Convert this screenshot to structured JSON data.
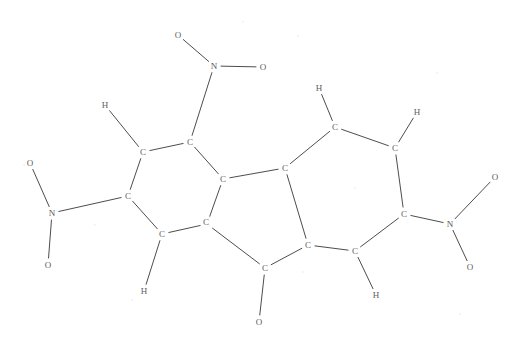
{
  "image": {
    "kind": "chemical-structure-diagram",
    "title": "",
    "width": 518,
    "height": 345,
    "background_color": "#ffffff",
    "bond_color": "#4d4d4d",
    "label_color": "#5b5b5b",
    "bond_width": 1
  },
  "molecule": {
    "core": "tricyclic fluorene-like skeleton: two six-membered carbon rings fused to a central five-membered ring",
    "substituents": "three nitro groups (N with two O) and one carbonyl oxygen",
    "atoms": [
      {
        "id": "O1",
        "label": "O",
        "element": "oxygen",
        "x": 178,
        "y": 35
      },
      {
        "id": "N1",
        "label": "N",
        "element": "nitrogen",
        "x": 214,
        "y": 66
      },
      {
        "id": "O2",
        "label": "O",
        "element": "oxygen",
        "x": 263,
        "y": 67
      },
      {
        "id": "C1",
        "label": "C",
        "element": "carbon",
        "x": 190,
        "y": 142
      },
      {
        "id": "H1",
        "label": "H",
        "element": "hydrogen",
        "x": 105,
        "y": 105
      },
      {
        "id": "C2",
        "label": "C",
        "element": "carbon",
        "x": 143,
        "y": 152
      },
      {
        "id": "C3",
        "label": "C",
        "element": "carbon",
        "x": 128,
        "y": 196
      },
      {
        "id": "N2",
        "label": "N",
        "element": "nitrogen",
        "x": 52,
        "y": 213
      },
      {
        "id": "O3",
        "label": "O",
        "element": "oxygen",
        "x": 30,
        "y": 163
      },
      {
        "id": "O4",
        "label": "O",
        "element": "oxygen",
        "x": 48,
        "y": 265
      },
      {
        "id": "C4",
        "label": "C",
        "element": "carbon",
        "x": 162,
        "y": 234
      },
      {
        "id": "H2",
        "label": "H",
        "element": "hydrogen",
        "x": 144,
        "y": 291
      },
      {
        "id": "C5",
        "label": "C",
        "element": "carbon",
        "x": 207,
        "y": 224
      },
      {
        "id": "C6",
        "label": "C",
        "element": "carbon",
        "x": 223,
        "y": 179
      },
      {
        "id": "C7",
        "label": "C",
        "element": "carbon",
        "x": 285,
        "y": 168
      },
      {
        "id": "C8",
        "label": "C",
        "element": "carbon",
        "x": 206,
        "y": 222
      },
      {
        "id": "C9",
        "label": "C",
        "element": "carbon",
        "x": 308,
        "y": 245
      },
      {
        "id": "C10",
        "label": "C",
        "element": "carbon",
        "x": 265,
        "y": 268
      },
      {
        "id": "O5",
        "label": "O",
        "element": "oxygen",
        "x": 259,
        "y": 322
      },
      {
        "id": "C11",
        "label": "C",
        "element": "carbon",
        "x": 335,
        "y": 127
      },
      {
        "id": "H3",
        "label": "H",
        "element": "hydrogen",
        "x": 319,
        "y": 88
      },
      {
        "id": "C12",
        "label": "C",
        "element": "carbon",
        "x": 395,
        "y": 148
      },
      {
        "id": "H4",
        "label": "H",
        "element": "hydrogen",
        "x": 417,
        "y": 112
      },
      {
        "id": "C13",
        "label": "C",
        "element": "carbon",
        "x": 404,
        "y": 214
      },
      {
        "id": "N3",
        "label": "N",
        "element": "nitrogen",
        "x": 450,
        "y": 224
      },
      {
        "id": "O6",
        "label": "O",
        "element": "oxygen",
        "x": 495,
        "y": 177
      },
      {
        "id": "O7",
        "label": "O",
        "element": "oxygen",
        "x": 470,
        "y": 267
      },
      {
        "id": "C14",
        "label": "C",
        "element": "carbon",
        "x": 355,
        "y": 251
      },
      {
        "id": "H5",
        "label": "H",
        "element": "hydrogen",
        "x": 376,
        "y": 295
      }
    ],
    "bonds": [
      {
        "from": "O1",
        "to": "N1",
        "order": 1
      },
      {
        "from": "N1",
        "to": "O2",
        "order": 1
      },
      {
        "from": "N1",
        "to": "C1",
        "order": 1
      },
      {
        "from": "C1",
        "to": "C2",
        "order": 1
      },
      {
        "from": "C2",
        "to": "H1",
        "order": 1
      },
      {
        "from": "C2",
        "to": "C3",
        "order": 1
      },
      {
        "from": "C3",
        "to": "N2",
        "order": 1
      },
      {
        "from": "N2",
        "to": "O3",
        "order": 1
      },
      {
        "from": "N2",
        "to": "O4",
        "order": 1
      },
      {
        "from": "C3",
        "to": "C4",
        "order": 1
      },
      {
        "from": "C4",
        "to": "H2",
        "order": 1
      },
      {
        "from": "C4",
        "to": "C5",
        "order": 1
      },
      {
        "from": "C5",
        "to": "C6",
        "order": 1
      },
      {
        "from": "C6",
        "to": "C1",
        "order": 1
      },
      {
        "from": "C6",
        "to": "C7",
        "order": 1
      },
      {
        "from": "C5",
        "to": "C10",
        "order": 1
      },
      {
        "from": "C7",
        "to": "C9",
        "order": 1
      },
      {
        "from": "C9",
        "to": "C10",
        "order": 1
      },
      {
        "from": "C10",
        "to": "O5",
        "order": 1
      },
      {
        "from": "C7",
        "to": "C11",
        "order": 1
      },
      {
        "from": "C11",
        "to": "H3",
        "order": 1
      },
      {
        "from": "C11",
        "to": "C12",
        "order": 1
      },
      {
        "from": "C12",
        "to": "H4",
        "order": 1
      },
      {
        "from": "C12",
        "to": "C13",
        "order": 1
      },
      {
        "from": "C13",
        "to": "N3",
        "order": 1
      },
      {
        "from": "N3",
        "to": "O6",
        "order": 1
      },
      {
        "from": "N3",
        "to": "O7",
        "order": 1
      },
      {
        "from": "C13",
        "to": "C14",
        "order": 1
      },
      {
        "from": "C14",
        "to": "H5",
        "order": 1
      },
      {
        "from": "C14",
        "to": "C9",
        "order": 1
      }
    ],
    "specks": [
      {
        "x": 243,
        "y": 22
      },
      {
        "x": 298,
        "y": 36
      },
      {
        "x": 437,
        "y": 73
      },
      {
        "x": 24,
        "y": 165
      },
      {
        "x": 355,
        "y": 188
      },
      {
        "x": 95,
        "y": 225
      },
      {
        "x": 303,
        "y": 272
      },
      {
        "x": 132,
        "y": 300
      },
      {
        "x": 460,
        "y": 314
      }
    ]
  },
  "chart_data": {
    "type": "diagram",
    "node_count": 29,
    "edge_count": 30,
    "element_counts": {
      "C": 14,
      "N": 3,
      "O": 7,
      "H": 5
    }
  }
}
